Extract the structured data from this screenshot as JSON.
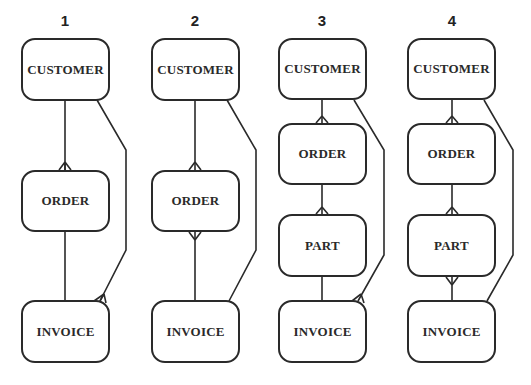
{
  "diagrams": [
    {
      "number": "1",
      "entities": [
        "CUSTOMER",
        "ORDER",
        "INVOICE"
      ],
      "relationships": [
        {
          "from": "CUSTOMER",
          "to": "ORDER",
          "many_end": "ORDER"
        },
        {
          "from": "ORDER",
          "to": "INVOICE",
          "many_end": "none"
        },
        {
          "from": "CUSTOMER",
          "to": "INVOICE",
          "many_end": "INVOICE"
        }
      ]
    },
    {
      "number": "2",
      "entities": [
        "CUSTOMER",
        "ORDER",
        "INVOICE"
      ],
      "relationships": [
        {
          "from": "CUSTOMER",
          "to": "ORDER",
          "many_end": "ORDER"
        },
        {
          "from": "ORDER",
          "to": "INVOICE",
          "many_end": "ORDER"
        },
        {
          "from": "CUSTOMER",
          "to": "INVOICE",
          "many_end": "none"
        }
      ]
    },
    {
      "number": "3",
      "entities": [
        "CUSTOMER",
        "ORDER",
        "PART",
        "INVOICE"
      ],
      "relationships": [
        {
          "from": "CUSTOMER",
          "to": "ORDER",
          "many_end": "ORDER"
        },
        {
          "from": "ORDER",
          "to": "PART",
          "many_end": "PART"
        },
        {
          "from": "PART",
          "to": "INVOICE",
          "many_end": "none"
        },
        {
          "from": "CUSTOMER",
          "to": "INVOICE",
          "many_end": "INVOICE"
        }
      ]
    },
    {
      "number": "4",
      "entities": [
        "CUSTOMER",
        "ORDER",
        "PART",
        "INVOICE"
      ],
      "relationships": [
        {
          "from": "CUSTOMER",
          "to": "ORDER",
          "many_end": "ORDER"
        },
        {
          "from": "ORDER",
          "to": "PART",
          "many_end": "PART"
        },
        {
          "from": "PART",
          "to": "INVOICE",
          "many_end": "PART"
        },
        {
          "from": "CUSTOMER",
          "to": "INVOICE",
          "many_end": "none"
        }
      ]
    }
  ],
  "colors": {
    "line": "#2a2a2a",
    "background": "#ffffff"
  }
}
